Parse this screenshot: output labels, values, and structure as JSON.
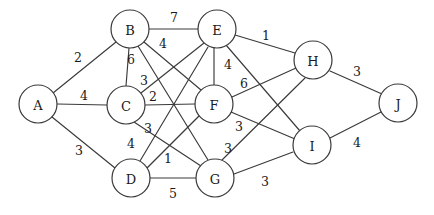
{
  "figure": {
    "name": "weighted-undirected-graph",
    "width": 434,
    "height": 215,
    "background_color": "#ffffff",
    "stroke_color": "#3a3a3a",
    "text_color": "#1a1a1a"
  },
  "chart_data": {
    "type": "diagram",
    "diagram_type": "weighted-undirected-graph",
    "title": "",
    "node_radius": 19,
    "nodes": [
      {
        "id": "A",
        "label": "A",
        "x": 38,
        "y": 104
      },
      {
        "id": "B",
        "label": "B",
        "x": 130,
        "y": 29
      },
      {
        "id": "C",
        "label": "C",
        "x": 126,
        "y": 105
      },
      {
        "id": "D",
        "label": "D",
        "x": 131,
        "y": 178
      },
      {
        "id": "E",
        "label": "E",
        "x": 217,
        "y": 29
      },
      {
        "id": "F",
        "label": "F",
        "x": 214,
        "y": 104
      },
      {
        "id": "G",
        "label": "G",
        "x": 215,
        "y": 178
      },
      {
        "id": "H",
        "label": "H",
        "x": 313,
        "y": 60
      },
      {
        "id": "I",
        "label": "I",
        "x": 312,
        "y": 145
      },
      {
        "id": "J",
        "label": "J",
        "x": 398,
        "y": 103
      }
    ],
    "edges": [
      {
        "source": "A",
        "target": "B",
        "weight": 2,
        "label_x": 78,
        "label_y": 57
      },
      {
        "source": "A",
        "target": "C",
        "weight": 4,
        "label_x": 84,
        "label_y": 96
      },
      {
        "source": "A",
        "target": "D",
        "weight": 3,
        "label_x": 79,
        "label_y": 150
      },
      {
        "source": "B",
        "target": "E",
        "weight": 7,
        "label_x": 174,
        "label_y": 18
      },
      {
        "source": "B",
        "target": "F",
        "weight": 4,
        "label_x": 162,
        "label_y": 43
      },
      {
        "source": "B",
        "target": "C",
        "weight": 6,
        "label_x": 132,
        "label_y": 59
      },
      {
        "source": "B",
        "target": "G",
        "weight": 3,
        "label_x": 143,
        "label_y": 80
      },
      {
        "source": "C",
        "target": "F",
        "weight": 2,
        "label_x": 153,
        "label_y": 97
      },
      {
        "source": "C",
        "target": "E",
        "weight": 3,
        "label_x": 148,
        "label_y": 128
      },
      {
        "source": "C",
        "target": "G",
        "weight": 4,
        "label_x": 131,
        "label_y": 143
      },
      {
        "source": "D",
        "target": "E",
        "weight": 1,
        "label_x": 167,
        "label_y": 158
      },
      {
        "source": "D",
        "target": "F",
        "weight": 5,
        "label_x": 173,
        "label_y": 193
      },
      {
        "source": "D",
        "target": "G",
        "weight": 5,
        "label_x": 173,
        "label_y": 193
      },
      {
        "source": "E",
        "target": "H",
        "weight": 1,
        "label_x": 266,
        "label_y": 36
      },
      {
        "source": "E",
        "target": "F",
        "weight": 4,
        "label_x": 227,
        "label_y": 64
      },
      {
        "source": "E",
        "target": "I",
        "weight": 6,
        "label_x": 243,
        "label_y": 84
      },
      {
        "source": "F",
        "target": "H",
        "weight": 6,
        "label_x": 243,
        "label_y": 84
      },
      {
        "source": "F",
        "target": "I",
        "weight": 3,
        "label_x": 239,
        "label_y": 126
      },
      {
        "source": "G",
        "target": "H",
        "weight": 3,
        "label_x": 228,
        "label_y": 148
      },
      {
        "source": "G",
        "target": "I",
        "weight": 3,
        "label_x": 265,
        "label_y": 181
      },
      {
        "source": "H",
        "target": "J",
        "weight": 3,
        "label_x": 357,
        "label_y": 72
      },
      {
        "source": "I",
        "target": "J",
        "weight": 4,
        "label_x": 357,
        "label_y": 142
      }
    ],
    "edge_label_values": [
      2,
      4,
      3,
      7,
      4,
      6,
      3,
      2,
      3,
      4,
      1,
      5,
      1,
      4,
      6,
      3,
      3,
      3,
      3,
      4
    ],
    "node_count": 10,
    "edge_count": 21
  },
  "drawn_edges": [
    {
      "name": "edge-A-B",
      "weight": "2",
      "x1": 53,
      "y1": 93,
      "x2": 116,
      "y2": 42,
      "lx": 78,
      "ly": 57
    },
    {
      "name": "edge-A-C",
      "weight": "4",
      "x1": 57,
      "y1": 104,
      "x2": 107,
      "y2": 105,
      "lx": 84,
      "ly": 95
    },
    {
      "name": "edge-A-D",
      "weight": "3",
      "x1": 52,
      "y1": 117,
      "x2": 115,
      "y2": 168,
      "lx": 79,
      "ly": 150
    },
    {
      "name": "edge-B-E",
      "weight": "7",
      "x1": 149,
      "y1": 29,
      "x2": 198,
      "y2": 29,
      "lx": 174,
      "ly": 17
    },
    {
      "name": "edge-B-F",
      "weight": "4",
      "x1": 144,
      "y1": 42,
      "x2": 201,
      "y2": 90,
      "lx": 163,
      "ly": 43
    },
    {
      "name": "edge-B-C",
      "weight": "6",
      "x1": 129,
      "y1": 48,
      "x2": 126,
      "y2": 86,
      "lx": 131,
      "ly": 59
    },
    {
      "name": "edge-B-G",
      "weight": "3",
      "x1": 138,
      "y1": 46,
      "x2": 208,
      "y2": 160,
      "lx": 144,
      "ly": 80
    },
    {
      "name": "edge-C-F",
      "weight": "2",
      "x1": 145,
      "y1": 105,
      "x2": 195,
      "y2": 104,
      "lx": 153,
      "ly": 96
    },
    {
      "name": "edge-C-E",
      "weight": "3",
      "x1": 141,
      "y1": 93,
      "x2": 204,
      "y2": 43,
      "lx": 148,
      "ly": 128
    },
    {
      "name": "edge-C-G",
      "weight": "4",
      "x1": 134,
      "y1": 122,
      "x2": 201,
      "y2": 166,
      "lx": 131,
      "ly": 143
    },
    {
      "name": "edge-D-E",
      "weight": "1",
      "x1": 140,
      "y1": 161,
      "x2": 208,
      "y2": 47,
      "lx": 168,
      "ly": 158
    },
    {
      "name": "edge-D-F",
      "weight": "",
      "x1": 145,
      "y1": 170,
      "x2": 199,
      "y2": 116,
      "lx": 0,
      "ly": 0
    },
    {
      "name": "edge-D-G",
      "weight": "5",
      "x1": 150,
      "y1": 178,
      "x2": 196,
      "y2": 178,
      "lx": 173,
      "ly": 193
    },
    {
      "name": "edge-E-H",
      "weight": "1",
      "x1": 235,
      "y1": 35,
      "x2": 295,
      "y2": 53,
      "lx": 266,
      "ly": 35
    },
    {
      "name": "edge-E-F",
      "weight": "4",
      "x1": 214,
      "y1": 48,
      "x2": 214,
      "y2": 85,
      "lx": 228,
      "ly": 64
    },
    {
      "name": "edge-E-I",
      "weight": "",
      "x1": 226,
      "y1": 45,
      "x2": 300,
      "y2": 131,
      "lx": 0,
      "ly": 0
    },
    {
      "name": "edge-F-H",
      "weight": "6",
      "x1": 232,
      "y1": 97,
      "x2": 296,
      "y2": 68,
      "lx": 244,
      "ly": 83
    },
    {
      "name": "edge-F-I",
      "weight": "3",
      "x1": 231,
      "y1": 112,
      "x2": 295,
      "y2": 139,
      "lx": 239,
      "ly": 126
    },
    {
      "name": "edge-G-H",
      "weight": "3",
      "x1": 222,
      "y1": 160,
      "x2": 305,
      "y2": 78,
      "lx": 228,
      "ly": 148
    },
    {
      "name": "edge-G-I",
      "weight": "3",
      "x1": 234,
      "y1": 174,
      "x2": 293,
      "y2": 152,
      "lx": 265,
      "ly": 181
    },
    {
      "name": "edge-H-J",
      "weight": "3",
      "x1": 330,
      "y1": 71,
      "x2": 382,
      "y2": 94,
      "lx": 357,
      "ly": 71
    },
    {
      "name": "edge-I-J",
      "weight": "4",
      "x1": 330,
      "y1": 138,
      "x2": 381,
      "y2": 112,
      "lx": 357,
      "ly": 142
    }
  ]
}
